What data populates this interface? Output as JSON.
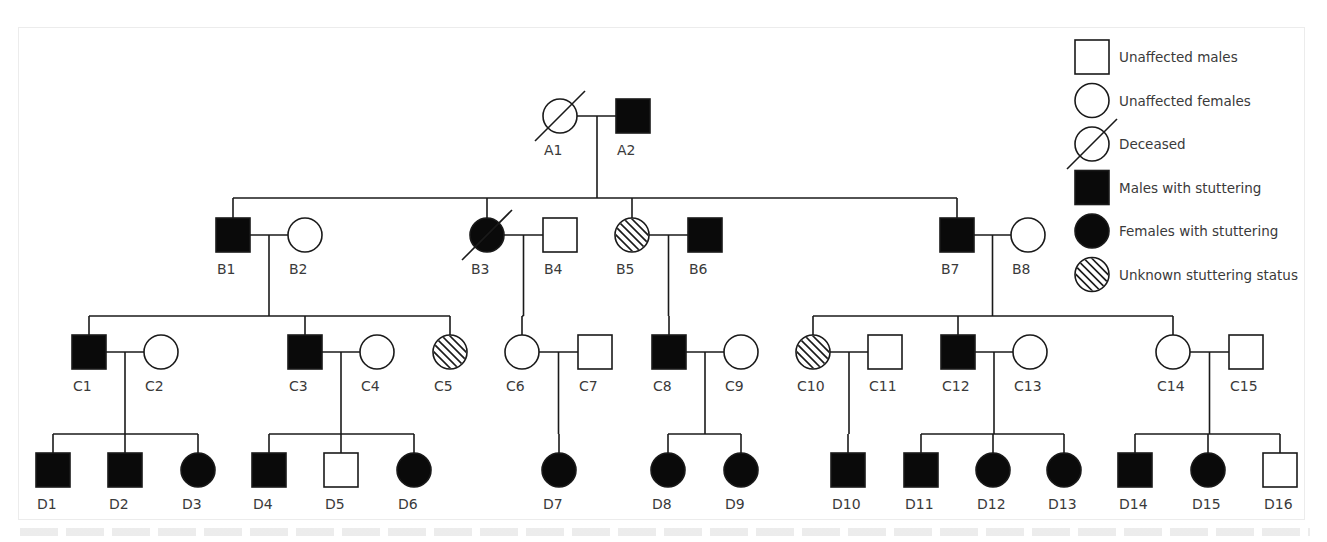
{
  "figure": {
    "type": "pedigree",
    "subject": "stuttering",
    "colors": {
      "line": "#1a1a1a",
      "affected": "#0a0a0a",
      "unaffected": "#ffffff",
      "text": "#3a3a3a",
      "frame": "#ececec"
    }
  },
  "legend": {
    "items": [
      {
        "symbol": "square-empty",
        "label": "Unaffected males"
      },
      {
        "symbol": "circle-empty",
        "label": "Unaffected females"
      },
      {
        "symbol": "circle-deceased",
        "label": "Deceased"
      },
      {
        "symbol": "square-filled",
        "label": "Males with stuttering"
      },
      {
        "symbol": "circle-filled",
        "label": "Females with stuttering"
      },
      {
        "symbol": "circle-hatched",
        "label": "Unknown stuttering status"
      }
    ]
  },
  "generations": [
    {
      "name": "A",
      "members": [
        {
          "id": "A1",
          "sex": "female",
          "status": "unaffected",
          "deceased": true
        },
        {
          "id": "A2",
          "sex": "male",
          "status": "affected",
          "deceased": false
        }
      ]
    },
    {
      "name": "B",
      "members": [
        {
          "id": "B1",
          "sex": "male",
          "status": "affected",
          "deceased": false
        },
        {
          "id": "B2",
          "sex": "female",
          "status": "unaffected",
          "deceased": false
        },
        {
          "id": "B3",
          "sex": "female",
          "status": "affected",
          "deceased": true
        },
        {
          "id": "B4",
          "sex": "male",
          "status": "unaffected",
          "deceased": false
        },
        {
          "id": "B5",
          "sex": "female",
          "status": "unknown",
          "deceased": false
        },
        {
          "id": "B6",
          "sex": "male",
          "status": "affected",
          "deceased": false
        },
        {
          "id": "B7",
          "sex": "male",
          "status": "affected",
          "deceased": false
        },
        {
          "id": "B8",
          "sex": "female",
          "status": "unaffected",
          "deceased": false
        }
      ]
    },
    {
      "name": "C",
      "members": [
        {
          "id": "C1",
          "sex": "male",
          "status": "affected",
          "deceased": false
        },
        {
          "id": "C2",
          "sex": "female",
          "status": "unaffected",
          "deceased": false
        },
        {
          "id": "C3",
          "sex": "male",
          "status": "affected",
          "deceased": false
        },
        {
          "id": "C4",
          "sex": "female",
          "status": "unaffected",
          "deceased": false
        },
        {
          "id": "C5",
          "sex": "female",
          "status": "unknown",
          "deceased": false
        },
        {
          "id": "C6",
          "sex": "female",
          "status": "unaffected",
          "deceased": false
        },
        {
          "id": "C7",
          "sex": "male",
          "status": "unaffected",
          "deceased": false
        },
        {
          "id": "C8",
          "sex": "male",
          "status": "affected",
          "deceased": false
        },
        {
          "id": "C9",
          "sex": "female",
          "status": "unaffected",
          "deceased": false
        },
        {
          "id": "C10",
          "sex": "female",
          "status": "unknown",
          "deceased": false
        },
        {
          "id": "C11",
          "sex": "male",
          "status": "unaffected",
          "deceased": false
        },
        {
          "id": "C12",
          "sex": "male",
          "status": "affected",
          "deceased": false
        },
        {
          "id": "C13",
          "sex": "female",
          "status": "unaffected",
          "deceased": false
        },
        {
          "id": "C14",
          "sex": "female",
          "status": "unaffected",
          "deceased": false
        },
        {
          "id": "C15",
          "sex": "male",
          "status": "unaffected",
          "deceased": false
        }
      ]
    },
    {
      "name": "D",
      "members": [
        {
          "id": "D1",
          "sex": "male",
          "status": "affected",
          "deceased": false
        },
        {
          "id": "D2",
          "sex": "male",
          "status": "affected",
          "deceased": false
        },
        {
          "id": "D3",
          "sex": "female",
          "status": "affected",
          "deceased": false
        },
        {
          "id": "D4",
          "sex": "male",
          "status": "affected",
          "deceased": false
        },
        {
          "id": "D5",
          "sex": "male",
          "status": "unaffected",
          "deceased": false
        },
        {
          "id": "D6",
          "sex": "female",
          "status": "affected",
          "deceased": false
        },
        {
          "id": "D7",
          "sex": "female",
          "status": "affected",
          "deceased": false
        },
        {
          "id": "D8",
          "sex": "female",
          "status": "affected",
          "deceased": false
        },
        {
          "id": "D9",
          "sex": "female",
          "status": "affected",
          "deceased": false
        },
        {
          "id": "D10",
          "sex": "male",
          "status": "affected",
          "deceased": false
        },
        {
          "id": "D11",
          "sex": "male",
          "status": "affected",
          "deceased": false
        },
        {
          "id": "D12",
          "sex": "female",
          "status": "affected",
          "deceased": false
        },
        {
          "id": "D13",
          "sex": "female",
          "status": "affected",
          "deceased": false
        },
        {
          "id": "D14",
          "sex": "male",
          "status": "affected",
          "deceased": false
        },
        {
          "id": "D15",
          "sex": "female",
          "status": "affected",
          "deceased": false
        },
        {
          "id": "D16",
          "sex": "male",
          "status": "unaffected",
          "deceased": false
        }
      ]
    }
  ],
  "couples": [
    {
      "partners": [
        "A1",
        "A2"
      ],
      "children": [
        "B1",
        "B3",
        "B5",
        "B7"
      ]
    },
    {
      "partners": [
        "B1",
        "B2"
      ],
      "children": [
        "C1",
        "C3",
        "C5"
      ]
    },
    {
      "partners": [
        "B3",
        "B4"
      ],
      "children": [
        "C6"
      ]
    },
    {
      "partners": [
        "B5",
        "B6"
      ],
      "children": [
        "C8"
      ]
    },
    {
      "partners": [
        "B7",
        "B8"
      ],
      "children": [
        "C10",
        "C12",
        "C14"
      ]
    },
    {
      "partners": [
        "C1",
        "C2"
      ],
      "children": [
        "D1",
        "D2",
        "D3"
      ]
    },
    {
      "partners": [
        "C3",
        "C4"
      ],
      "children": [
        "D4",
        "D5",
        "D6"
      ]
    },
    {
      "partners": [
        "C6",
        "C7"
      ],
      "children": [
        "D7"
      ]
    },
    {
      "partners": [
        "C8",
        "C9"
      ],
      "children": [
        "D8",
        "D9"
      ]
    },
    {
      "partners": [
        "C10",
        "C11"
      ],
      "children": [
        "D10"
      ]
    },
    {
      "partners": [
        "C12",
        "C13"
      ],
      "children": [
        "D11",
        "D12",
        "D13"
      ]
    },
    {
      "partners": [
        "C14",
        "C15"
      ],
      "children": [
        "D14",
        "D15",
        "D16"
      ]
    }
  ]
}
